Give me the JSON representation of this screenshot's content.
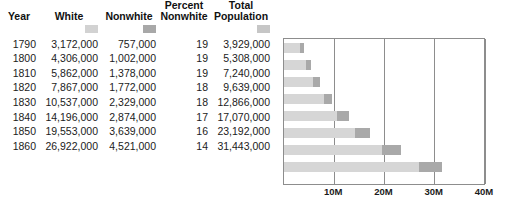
{
  "table": {
    "headers": [
      "Year",
      "White",
      "Nonwhite",
      "Percent Nonwhite",
      "Total Population"
    ],
    "header_lines": {
      "year": [
        "",
        "Year"
      ],
      "white": [
        "",
        "White"
      ],
      "nonwhite": [
        "",
        "Nonwhite"
      ],
      "percent_nonwhite": [
        "Percent",
        "Nonwhite"
      ],
      "total_population": [
        "Total",
        "Population"
      ]
    },
    "rows": [
      {
        "year": "1790",
        "white": "3,172,000",
        "nonwhite": "757,000",
        "percent_nonwhite": "19",
        "total_population": "3,929,000"
      },
      {
        "year": "1800",
        "white": "4,306,000",
        "nonwhite": "1,002,000",
        "percent_nonwhite": "19",
        "total_population": "5,308,000"
      },
      {
        "year": "1810",
        "white": "5,862,000",
        "nonwhite": "1,378,000",
        "percent_nonwhite": "19",
        "total_population": "7,240,000"
      },
      {
        "year": "1820",
        "white": "7,867,000",
        "nonwhite": "1,772,000",
        "percent_nonwhite": "18",
        "total_population": "9,639,000"
      },
      {
        "year": "1830",
        "white": "10,537,000",
        "nonwhite": "2,329,000",
        "percent_nonwhite": "18",
        "total_population": "12,866,000"
      },
      {
        "year": "1840",
        "white": "14,196,000",
        "nonwhite": "2,874,000",
        "percent_nonwhite": "17",
        "total_population": "17,070,000"
      },
      {
        "year": "1850",
        "white": "19,553,000",
        "nonwhite": "3,639,000",
        "percent_nonwhite": "16",
        "total_population": "23,192,000"
      },
      {
        "year": "1860",
        "white": "26,922,000",
        "nonwhite": "4,521,000",
        "percent_nonwhite": "14",
        "total_population": "31,443,000"
      }
    ]
  },
  "legend_swatches": [
    {
      "label": "White",
      "color": "#d2d2d2"
    },
    {
      "label": "Nonwhite",
      "color": "#a8a8a8"
    },
    {
      "label": "Total Population",
      "color": "#c6c6c6"
    }
  ],
  "credit": "© Cengage Learning",
  "chart_data": {
    "type": "bar",
    "orientation": "horizontal",
    "stacked": true,
    "title": "",
    "xlabel": "",
    "ylabel": "",
    "categories": [
      "1790",
      "1800",
      "1810",
      "1820",
      "1830",
      "1840",
      "1850",
      "1860"
    ],
    "series": [
      {
        "name": "White",
        "color": "#d6d6d6",
        "values": [
          3172000,
          4306000,
          5862000,
          7867000,
          10537000,
          14196000,
          19553000,
          26922000
        ]
      },
      {
        "name": "Nonwhite",
        "color": "#a9a9a9",
        "values": [
          757000,
          1002000,
          1378000,
          1772000,
          2329000,
          2874000,
          3639000,
          4521000
        ]
      }
    ],
    "totals": [
      3929000,
      5308000,
      7240000,
      9639000,
      12866000,
      17070000,
      23192000,
      31443000
    ],
    "xlim": [
      0,
      40000000
    ],
    "xticks": [
      10000000,
      20000000,
      30000000,
      40000000
    ],
    "xtick_labels": [
      "10M",
      "20M",
      "30M",
      "40M"
    ],
    "grid": true,
    "legend_position": "table-header"
  }
}
